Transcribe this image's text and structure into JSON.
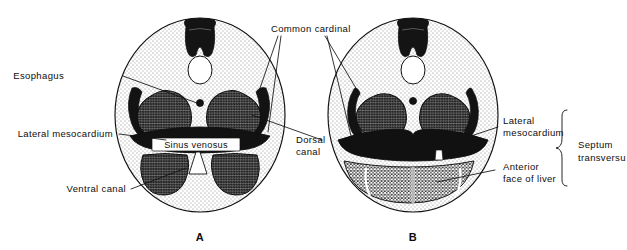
{
  "figure": {
    "panels": [
      {
        "letter": "A"
      },
      {
        "letter": "B"
      }
    ]
  },
  "labels": {
    "esophagus": "Esophagus",
    "lateral_mesocardium_left": "Lateral mesocardium",
    "sinus_venosus": "Sinus venosus",
    "ventral_canal": "Ventral canal",
    "common_cardinal": "Common cardinal",
    "dorsal_canal_line1": "Dorsal",
    "dorsal_canal_line2": "canal",
    "lateral_mesocardium_right_line1": "Lateral",
    "lateral_mesocardium_right_line2": "mesocardium",
    "anterior_face_of_liver_line1": "Anterior",
    "anterior_face_of_liver_line2": "face of liver",
    "septum_transversum_line1": "Septum",
    "septum_transversum_line2": "transversu"
  },
  "colors": {
    "ink": "#111111",
    "paper": "#ffffff",
    "stipple_light": "#b9b9b9",
    "stipple_mid": "#6e6e6e",
    "stipple_dark": "#1c1c1c"
  }
}
